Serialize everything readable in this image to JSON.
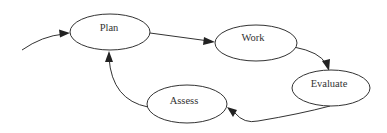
{
  "diagram": {
    "type": "cycle",
    "title": "",
    "nodes": [
      {
        "id": "plan",
        "label": "Plan",
        "cx": 110,
        "cy": 32,
        "rx": 40,
        "ry": 18
      },
      {
        "id": "work",
        "label": "Work",
        "cx": 256,
        "cy": 43,
        "rx": 41,
        "ry": 18
      },
      {
        "id": "evaluate",
        "label": "Evaluate",
        "cx": 331,
        "cy": 88,
        "rx": 39,
        "ry": 18
      },
      {
        "id": "assess",
        "label": "Assess",
        "cx": 187,
        "cy": 104,
        "rx": 40,
        "ry": 19
      }
    ],
    "edges": [
      {
        "from": "entry",
        "to": "plan"
      },
      {
        "from": "plan",
        "to": "work"
      },
      {
        "from": "work",
        "to": "evaluate"
      },
      {
        "from": "evaluate",
        "to": "assess"
      },
      {
        "from": "assess",
        "to": "plan"
      }
    ],
    "colors": {
      "stroke": "#333333",
      "fill": "#ffffff",
      "text": "#333333"
    }
  }
}
